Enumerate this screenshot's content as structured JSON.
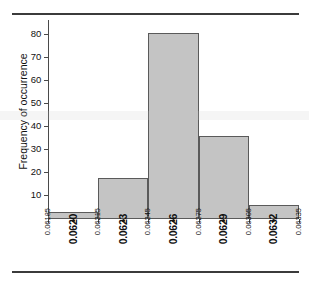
{
  "figure": {
    "background_color": "#ffffff",
    "rule_color": "#3b3b3b",
    "axis_color": "#4a4a4a",
    "bar_fill_color": "#c4c4c4",
    "bar_edge_color": "#5a5a5a"
  },
  "chart_data": {
    "type": "bar",
    "title": "",
    "subtitle": "",
    "xlabel": "",
    "ylabel": "Frequency of occurrence",
    "categories": [
      "0.06185-0.06215",
      "0.06215-0.06245",
      "0.06245-0.06275",
      "0.06275-0.06305",
      "0.06305-0.06335"
    ],
    "bin_edges": [
      0.06185,
      0.06215,
      0.06245,
      0.06275,
      0.06305,
      0.06335
    ],
    "values": [
      3,
      18,
      81,
      36,
      6
    ],
    "bin_centers": [
      0.062,
      0.0623,
      0.0626,
      0.0629,
      0.0632
    ],
    "ylim": [
      0,
      86
    ],
    "xlim": [
      0.06185,
      0.06335
    ],
    "grid": false,
    "legend": null,
    "y_ticks": [
      10,
      20,
      30,
      40,
      50,
      60,
      70,
      80
    ],
    "y_tick_labels": [
      "10",
      "20",
      "30",
      "40",
      "50",
      "60",
      "70",
      "80"
    ],
    "x_tick_labels": [
      {
        "text": "0.06185",
        "value": 0.06185,
        "style": "minor"
      },
      {
        "text": "0.0620",
        "value": 0.062,
        "style": "major"
      },
      {
        "text": "0.06215",
        "value": 0.06215,
        "style": "minor"
      },
      {
        "text": "0.0623",
        "value": 0.0623,
        "style": "major"
      },
      {
        "text": "0.06245",
        "value": 0.06245,
        "style": "minor"
      },
      {
        "text": "0.0626",
        "value": 0.0626,
        "style": "major"
      },
      {
        "text": "0.06275",
        "value": 0.06275,
        "style": "minor"
      },
      {
        "text": "0.0629",
        "value": 0.0629,
        "style": "major"
      },
      {
        "text": "0.06305",
        "value": 0.06305,
        "style": "minor"
      },
      {
        "text": "0.0632",
        "value": 0.0632,
        "style": "major"
      },
      {
        "text": "0.06335",
        "value": 0.06335,
        "style": "minor"
      }
    ]
  }
}
